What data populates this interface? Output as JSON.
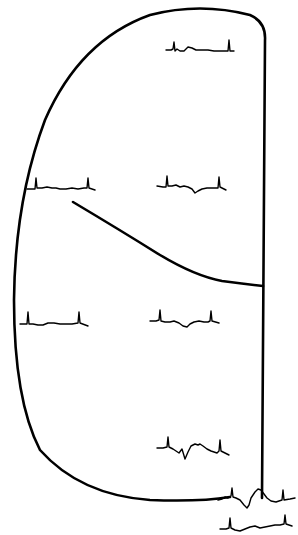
{
  "diagram": {
    "background": "#ffffff",
    "stroke_color": "#000000",
    "outline": {
      "name": "heart-outline",
      "d": "M262,498 L265,40 Q266,22 250,15 Q200,2 150,15 Q80,40 45,120 Q15,200 14,300 Q14,400 40,450 Q80,495 150,500 Q200,502 230,497"
    },
    "divider": {
      "name": "septal-divider-line",
      "d": "M73,202 Q120,230 160,255 Q195,276 222,281 Q245,284 263,286"
    },
    "traces": [
      {
        "name": "ecg-trace-top-right",
        "d": "M166,50 L171,50 L173,49 L174,42 L175,51 L177,49 L180,51 L184,51 L188,47 L192,48 L196,50 L202,50 L208,50 L214,51 L220,51 L228,51 L229,40 L230,51 L234,51"
      },
      {
        "name": "ecg-trace-mid-left",
        "d": "M27,189 L32,189 L35,189 L36,178 L37,188 L42,188 L47,187 L52,188 L56,188 L60,189 L66,189 L72,188 L78,189 L84,188 L87,188 L88,178 L89,188 L95,190"
      },
      {
        "name": "ecg-trace-mid-right",
        "d": "M157,186 L163,187 L166,187 L167,176 L168,186 L172,186 L176,185 L180,187 L184,186 L188,187 L192,189 L195,193 L198,191 L202,189 L207,188 L212,188 L218,188 L219,177 L220,187 L226,190"
      },
      {
        "name": "ecg-trace-lower-left",
        "d": "M20,324 L25,324 L27,324 L28,312 L29,324 L33,324 L38,325 L43,325 L48,323 L54,323 L60,324 L66,324 L72,324 L78,323 L79,312 L80,323 L88,326"
      },
      {
        "name": "ecg-trace-lower-right",
        "d": "M150,321 L156,321 L159,320 L160,310 L161,321 L165,322 L170,322 L174,321 L179,323 L183,326 L187,327 L190,324 L194,322 L199,321 L204,322 L208,322 L210,321 L211,311 L212,321 L219,323"
      },
      {
        "name": "ecg-trace-bottom-center",
        "d": "M157,448 L163,448 L167,447 L168,437 L169,447 L173,449 L176,451 L179,453 L182,449 L185,459 L188,452 L191,446 L195,444 L198,445 L200,444 L203,446 L207,449 L211,451 L217,453 L219,451 L220,440 L221,451 L229,455"
      },
      {
        "name": "ecg-trace-bottom-right",
        "d": "M218,500 L222,499 L225,497 L228,498 L231,496 L232,488 L233,497 L236,498 L240,500 L244,505 L247,508 L249,505 L251,498 L255,492 L258,489 L261,490 L264,494 L267,498 L271,501 L276,502 L282,500 L283,490 L284,500 L290,499 L295,498"
      },
      {
        "name": "ecg-trace-bottom-lower",
        "d": "M220,529 L226,529 L229,528 L230,518 L231,528 L235,530 L240,531 L245,529 L250,527 L255,526 L260,528 L265,527 L270,526 L275,525 L280,525 L284,524 L285,515 L286,524 L292,526"
      }
    ]
  }
}
